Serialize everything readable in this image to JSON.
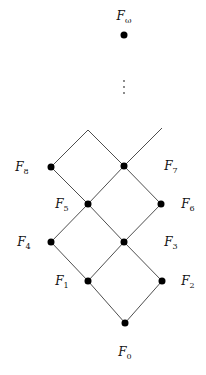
{
  "diagram": {
    "nodes": [
      {
        "id": "F_omega",
        "label": "F",
        "subscript": "ω"
      },
      {
        "id": "F8",
        "label": "F",
        "subscript": "8"
      },
      {
        "id": "F7",
        "label": "F",
        "subscript": "7"
      },
      {
        "id": "F6",
        "label": "F",
        "subscript": "6"
      },
      {
        "id": "F5",
        "label": "F",
        "subscript": "5"
      },
      {
        "id": "F4",
        "label": "F",
        "subscript": "4"
      },
      {
        "id": "F3",
        "label": "F",
        "subscript": "3"
      },
      {
        "id": "F2",
        "label": "F",
        "subscript": "2"
      },
      {
        "id": "F1",
        "label": "F",
        "subscript": "1"
      },
      {
        "id": "F0",
        "label": "F",
        "subscript": "0"
      }
    ],
    "edges": [
      [
        "F0",
        "F1"
      ],
      [
        "F0",
        "F2"
      ],
      [
        "F1",
        "F4"
      ],
      [
        "F1",
        "F3"
      ],
      [
        "F2",
        "F3"
      ],
      [
        "F4",
        "F5"
      ],
      [
        "F3",
        "F5"
      ],
      [
        "F3",
        "F6"
      ],
      [
        "F5",
        "F8"
      ],
      [
        "F5",
        "F7"
      ],
      [
        "F6",
        "F7"
      ],
      [
        "F8",
        "top-open"
      ],
      [
        "F7",
        "top-open"
      ],
      [
        "F7",
        "right-open"
      ]
    ],
    "ellipsis": "⋮"
  }
}
